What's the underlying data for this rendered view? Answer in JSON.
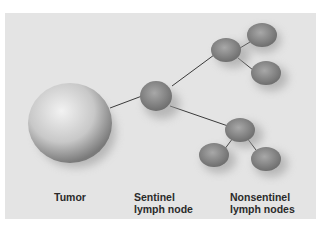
{
  "diagram": {
    "labels": {
      "tumor": "Tumor",
      "sentinel_line1": "Sentinel",
      "sentinel_line2": "lymph node",
      "nonsentinel_line1": "Nonsentinel",
      "nonsentinel_line2": "lymph nodes"
    },
    "colors": {
      "background": "#e4e4e4",
      "tumor": "#cfcfcf",
      "node": "#8f8f8f",
      "connector": "#3a3a3a"
    }
  }
}
